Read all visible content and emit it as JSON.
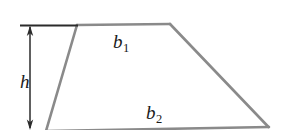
{
  "figure": {
    "type": "geometry-diagram",
    "shape": "trapezoid",
    "background_color": "#ffffff",
    "shape_stroke_color": "#8a8a8a",
    "annotation_stroke_color": "#1a1a1a",
    "labels": {
      "height": "h",
      "top_base": "b",
      "top_base_subscript": "1",
      "bottom_base": "b",
      "bottom_base_subscript": "2"
    },
    "geometry": {
      "top_left_vertex": [
        77,
        25
      ],
      "top_right_vertex": [
        170,
        24
      ],
      "bottom_right_vertex": [
        268,
        127
      ],
      "bottom_left_vertex": [
        46,
        130
      ],
      "height_arrow_x": 30,
      "height_arrow_top_y": 26,
      "height_arrow_bottom_y": 129,
      "tick_line_left_x": 20,
      "tick_line_right_x": 78,
      "tick_line_y": 25
    }
  }
}
